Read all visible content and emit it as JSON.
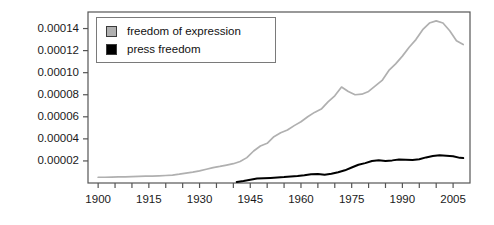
{
  "chart_data": {
    "type": "line",
    "title": "",
    "xlabel": "",
    "ylabel": "",
    "xlim": [
      1897,
      2010
    ],
    "ylim": [
      0,
      0.000155
    ],
    "grid": false,
    "legend_position": "top-left",
    "xticks": [
      1900,
      1905,
      1910,
      1915,
      1920,
      1925,
      1930,
      1935,
      1940,
      1945,
      1950,
      1955,
      1960,
      1965,
      1970,
      1975,
      1980,
      1985,
      1990,
      1995,
      2000,
      2005
    ],
    "xtick_labels": [
      "1900",
      "1915",
      "1930",
      "1945",
      "1960",
      "1975",
      "1990",
      "2005"
    ],
    "xtick_labeled_values": [
      1900,
      1915,
      1930,
      1945,
      1960,
      1975,
      1990,
      2005
    ],
    "yticks": [
      2e-05,
      4e-05,
      6e-05,
      8e-05,
      0.0001,
      0.00012,
      0.00014
    ],
    "ytick_labels": [
      "0.00002",
      "0.00004",
      "0.00006",
      "0.00008",
      "0.00010",
      "0.00012",
      "0.00014"
    ],
    "series": [
      {
        "name": "freedom of expression",
        "color": "#b0b0b0",
        "x": [
          1900,
          1902,
          1904,
          1906,
          1908,
          1910,
          1912,
          1914,
          1916,
          1918,
          1920,
          1922,
          1924,
          1926,
          1928,
          1930,
          1932,
          1934,
          1936,
          1938,
          1940,
          1942,
          1944,
          1946,
          1948,
          1950,
          1952,
          1954,
          1956,
          1958,
          1960,
          1962,
          1964,
          1966,
          1968,
          1970,
          1972,
          1974,
          1976,
          1978,
          1980,
          1982,
          1984,
          1986,
          1988,
          1990,
          1992,
          1994,
          1996,
          1998,
          2000,
          2002,
          2004,
          2006,
          2008
        ],
        "values": [
          5.2e-06,
          5.2e-06,
          5.4e-06,
          5.5e-06,
          5.6e-06,
          5.8e-06,
          6e-06,
          6.2e-06,
          6.3e-06,
          6.5e-06,
          6.8e-06,
          7.2e-06,
          8e-06,
          9e-06,
          9.8e-06,
          1.1e-05,
          1.25e-05,
          1.4e-05,
          1.5e-05,
          1.62e-05,
          1.75e-05,
          1.95e-05,
          2.3e-05,
          2.9e-05,
          3.35e-05,
          3.6e-05,
          4.2e-05,
          4.55e-05,
          4.8e-05,
          5.2e-05,
          5.55e-05,
          6e-05,
          6.4e-05,
          6.7e-05,
          7.35e-05,
          7.9e-05,
          8.7e-05,
          8.3e-05,
          8e-05,
          8.05e-05,
          8.3e-05,
          8.8e-05,
          9.3e-05,
          0.000102,
          0.000108,
          0.000115,
          0.000123,
          0.00013,
          0.000139,
          0.000145,
          0.000147,
          0.000145,
          0.000138,
          0.000129,
          0.0001255
        ]
      },
      {
        "name": "press freedom",
        "color": "#000000",
        "x": [
          1941,
          1943,
          1945,
          1947,
          1949,
          1951,
          1953,
          1955,
          1957,
          1959,
          1961,
          1963,
          1965,
          1967,
          1969,
          1971,
          1973,
          1975,
          1977,
          1979,
          1981,
          1983,
          1985,
          1987,
          1989,
          1991,
          1993,
          1995,
          1997,
          1999,
          2001,
          2003,
          2005,
          2007,
          2008
        ],
        "values": [
          1e-06,
          1.8e-06,
          3e-06,
          4e-06,
          4.3e-06,
          4.6e-06,
          5e-06,
          5.4e-06,
          6e-06,
          6.3e-06,
          7e-06,
          8e-06,
          8.2e-06,
          7.5e-06,
          8.3e-06,
          9.8e-06,
          1.15e-05,
          1.4e-05,
          1.65e-05,
          1.8e-05,
          2e-05,
          2.06e-05,
          2e-05,
          2.05e-05,
          2.12e-05,
          2.1e-05,
          2.09e-05,
          2.15e-05,
          2.32e-05,
          2.45e-05,
          2.52e-05,
          2.48e-05,
          2.43e-05,
          2.28e-05,
          2.26e-05
        ]
      }
    ]
  },
  "legend": {
    "items": [
      {
        "label": "freedom of expression",
        "color": "#b0b0b0"
      },
      {
        "label": "press freedom",
        "color": "#000000"
      }
    ]
  },
  "axis_colors": {
    "frame": "#555555",
    "tick": "#555555",
    "text": "#111111"
  }
}
